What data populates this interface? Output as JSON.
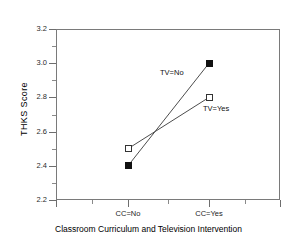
{
  "chart_data": {
    "type": "line",
    "title": "",
    "xlabel": "Classroom Curriculum and Television Intervention",
    "ylabel": "THKS Score",
    "categories": [
      "CC=No",
      "CC=Yes"
    ],
    "ylim": [
      2.2,
      3.2
    ],
    "ytick_labels": [
      "2.2",
      "2.4",
      "2.6",
      "2.8",
      "3.0",
      "3.2"
    ],
    "ytick_values": [
      2.2,
      2.4,
      2.6,
      2.8,
      3.0,
      3.2
    ],
    "yminor_values": [
      2.3,
      2.5,
      2.7,
      2.9,
      3.1
    ],
    "grid": false,
    "legend_position": "inline-annotations",
    "series": [
      {
        "name": "TV=No",
        "marker": "filled-square",
        "values": [
          2.4,
          3.0
        ],
        "annotation": "TV=No"
      },
      {
        "name": "TV=Yes",
        "marker": "open-square",
        "values": [
          2.5,
          2.8
        ],
        "annotation": "TV=Yes"
      }
    ],
    "annotations": [
      {
        "text": "TV=No",
        "x": 2.63,
        "y": 2.9
      },
      {
        "text": "TV=Yes",
        "x": 2.98,
        "y": 2.745
      }
    ]
  }
}
